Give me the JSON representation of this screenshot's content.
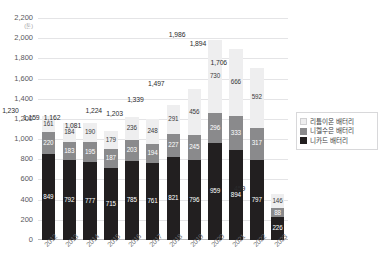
{
  "title_strip": "",
  "axis": {
    "y_unit": "(톤)",
    "y_ticks": [
      "2,200",
      "2,000",
      "1,800",
      "1,600",
      "1,400",
      "1,200",
      "1,000",
      "800",
      "600",
      "400",
      "200"
    ],
    "zero_label": "0"
  },
  "legend": {
    "items": [
      {
        "label": "리튬이온 배터리",
        "color": "#eeeeef",
        "key": "liion"
      },
      {
        "label": "니켈수은 배터리",
        "color": "#8a8a8c",
        "key": "nimh"
      },
      {
        "label": "니카드 배터리",
        "color": "#221f20",
        "key": "nicd"
      }
    ]
  },
  "chart_data": {
    "type": "bar",
    "stacked": true,
    "title": "",
    "xlabel": "",
    "ylabel": "",
    "yunit": "(톤)",
    "ylim": [
      0,
      2200
    ],
    "ytick_step": 200,
    "grid": true,
    "legend_position": "right",
    "categories": [
      "2012",
      "2013",
      "2014",
      "2015",
      "2016",
      "2017",
      "2018",
      "2019",
      "2020",
      "2021",
      "2022",
      "2023"
    ],
    "series": [
      {
        "name": "니카드 배터리",
        "color": "#221f20",
        "values": [
          849,
          792,
          777,
          715,
          785,
          761,
          821,
          796,
          959,
          894,
          797,
          226
        ]
      },
      {
        "name": "니켈수은 배터리",
        "color": "#8a8a8c",
        "values": [
          220,
          183,
          195,
          187,
          203,
          194,
          227,
          245,
          296,
          333,
          317,
          88
        ]
      },
      {
        "name": "리튬이온 배터리",
        "color": "#eeeeef",
        "values": [
          161,
          184,
          190,
          179,
          236,
          248,
          291,
          456,
          730,
          666,
          592,
          146
        ]
      }
    ],
    "totals": [
      1230,
      1159,
      1162,
      1081,
      1224,
      1203,
      1339,
      1497,
      1986,
      1894,
      1706,
      459
    ],
    "total_labels": [
      "1,230",
      "1,159",
      "1,162",
      "1,081",
      "1,224",
      "1,203",
      "1,339",
      "1,497",
      "1,986",
      "1,894",
      "1,706",
      "459"
    ]
  }
}
